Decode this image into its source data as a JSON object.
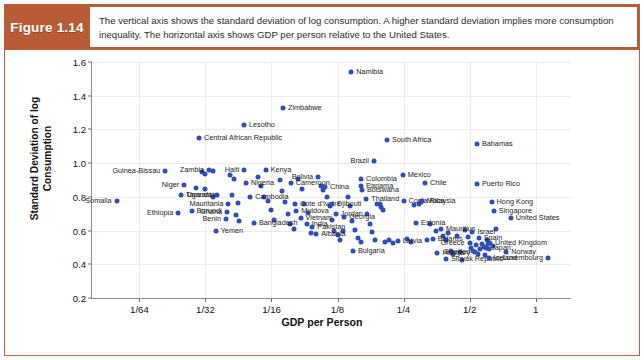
{
  "figure": {
    "badge": "Figure 1.14",
    "caption": "The vertical axis shows the standard deviation of log consumption. A higher standard deviation implies more consumption inequality. The horizontal axis shows GDP per person relative to the United States.",
    "badge_color": "#b95b34",
    "border_color": "#b9613f",
    "dot_color": "#2f4fb5"
  },
  "chart_data": {
    "type": "scatter",
    "title": "",
    "xlabel": "GDP per Person",
    "ylabel": "Standard Deviation of log Consumption",
    "xscale": "log2",
    "xlim": [
      0.0095,
      1.45
    ],
    "ylim": [
      0.2,
      1.6
    ],
    "xticks": [
      {
        "value": 0.015625,
        "label": "1/64"
      },
      {
        "value": 0.03125,
        "label": "1/32"
      },
      {
        "value": 0.0625,
        "label": "1/16"
      },
      {
        "value": 0.125,
        "label": "1/8"
      },
      {
        "value": 0.25,
        "label": "1/4"
      },
      {
        "value": 0.5,
        "label": "1/2"
      },
      {
        "value": 1.0,
        "label": "1"
      }
    ],
    "yticks": [
      0.2,
      0.4,
      0.6,
      0.8,
      1.0,
      1.2,
      1.4,
      1.6
    ],
    "grid": true,
    "legend": "none",
    "points": [
      {
        "name": "Somalia",
        "x": 0.0123,
        "y": 0.775,
        "side": "left"
      },
      {
        "name": "Guinea-Bissau",
        "x": 0.0205,
        "y": 0.952,
        "side": "left"
      },
      {
        "name": "Niger",
        "x": 0.025,
        "y": 0.87,
        "side": "left"
      },
      {
        "name": "Tanzania",
        "x": 0.0242,
        "y": 0.812,
        "side": "right"
      },
      {
        "name": "Ethiopia",
        "x": 0.0235,
        "y": 0.705,
        "side": "left"
      },
      {
        "name": "Burundi",
        "x": 0.027,
        "y": 0.718,
        "side": "right"
      },
      {
        "name": "Zambia",
        "x": 0.0325,
        "y": 0.96,
        "side": "left"
      },
      {
        "name": "Central African Republic",
        "x": 0.0292,
        "y": 1.148,
        "side": "right"
      },
      {
        "name": "Uganda",
        "x": 0.0353,
        "y": 0.81,
        "side": "left"
      },
      {
        "name": "Mauritania",
        "x": 0.0398,
        "y": 0.755,
        "side": "left"
      },
      {
        "name": "Ghana",
        "x": 0.0392,
        "y": 0.712,
        "side": "left"
      },
      {
        "name": "Benin",
        "x": 0.0388,
        "y": 0.668,
        "side": "left"
      },
      {
        "name": "Yemen",
        "x": 0.0348,
        "y": 0.6,
        "side": "right"
      },
      {
        "name": "Lesotho",
        "x": 0.0468,
        "y": 1.228,
        "side": "right"
      },
      {
        "name": "Haiti",
        "x": 0.047,
        "y": 0.96,
        "side": "left"
      },
      {
        "name": "Nigeria",
        "x": 0.0478,
        "y": 0.885,
        "side": "right"
      },
      {
        "name": "Cambodia",
        "x": 0.05,
        "y": 0.798,
        "side": "right"
      },
      {
        "name": "Bangladesh",
        "x": 0.052,
        "y": 0.642,
        "side": "right"
      },
      {
        "name": "Kenya",
        "x": 0.0588,
        "y": 0.958,
        "side": "right"
      },
      {
        "name": "Zimbabwe",
        "x": 0.0705,
        "y": 1.33,
        "side": "right"
      },
      {
        "name": "Cameroon",
        "x": 0.0765,
        "y": 0.88,
        "side": "right"
      },
      {
        "name": "Cote d'Ivoire",
        "x": 0.08,
        "y": 0.76,
        "side": "right"
      },
      {
        "name": "Moldova",
        "x": 0.081,
        "y": 0.718,
        "side": "right"
      },
      {
        "name": "Vietnam",
        "x": 0.0848,
        "y": 0.672,
        "side": "right"
      },
      {
        "name": "India",
        "x": 0.0905,
        "y": 0.64,
        "side": "right"
      },
      {
        "name": "Pakistan",
        "x": 0.096,
        "y": 0.622,
        "side": "right"
      },
      {
        "name": "Albania",
        "x": 0.1,
        "y": 0.578,
        "side": "right"
      },
      {
        "name": "Bolivia",
        "x": 0.102,
        "y": 0.918,
        "side": "left"
      },
      {
        "name": "China",
        "x": 0.1095,
        "y": 0.858,
        "side": "right"
      },
      {
        "name": "Djibouti",
        "x": 0.118,
        "y": 0.758,
        "side": "right"
      },
      {
        "name": "Jordan",
        "x": 0.1225,
        "y": 0.7,
        "side": "right"
      },
      {
        "name": "Georgia",
        "x": 0.134,
        "y": 0.682,
        "side": "right"
      },
      {
        "name": "Namibia",
        "x": 0.1445,
        "y": 1.54,
        "side": "right"
      },
      {
        "name": "Colombia",
        "x": 0.16,
        "y": 0.905,
        "side": "right"
      },
      {
        "name": "Panama",
        "x": 0.16,
        "y": 0.862,
        "side": "right"
      },
      {
        "name": "Botswana",
        "x": 0.1615,
        "y": 0.838,
        "side": "right"
      },
      {
        "name": "Thailand",
        "x": 0.169,
        "y": 0.79,
        "side": "right"
      },
      {
        "name": "Brazil",
        "x": 0.183,
        "y": 1.01,
        "side": "left"
      },
      {
        "name": "Bulgaria",
        "x": 0.147,
        "y": 0.478,
        "side": "right"
      },
      {
        "name": "South Africa",
        "x": 0.21,
        "y": 1.135,
        "side": "right"
      },
      {
        "name": "Mexico",
        "x": 0.248,
        "y": 0.93,
        "side": "right"
      },
      {
        "name": "Costa Rica",
        "x": 0.25,
        "y": 0.778,
        "side": "right"
      },
      {
        "name": "Latvia",
        "x": 0.235,
        "y": 0.54,
        "side": "right"
      },
      {
        "name": "Estonia",
        "x": 0.285,
        "y": 0.645,
        "side": "right"
      },
      {
        "name": "Chile",
        "x": 0.313,
        "y": 0.88,
        "side": "right"
      },
      {
        "name": "Malaysia",
        "x": 0.303,
        "y": 0.775,
        "side": "right"
      },
      {
        "name": "Belarus",
        "x": 0.34,
        "y": 0.548,
        "side": "right"
      },
      {
        "name": "Mauritius",
        "x": 0.37,
        "y": 0.612,
        "side": "right"
      },
      {
        "name": "Hungary",
        "x": 0.357,
        "y": 0.468,
        "side": "right"
      },
      {
        "name": "Slovak Republic",
        "x": 0.39,
        "y": 0.43,
        "side": "right"
      },
      {
        "name": "Bahamas",
        "x": 0.54,
        "y": 1.112,
        "side": "right"
      },
      {
        "name": "Puerto Rico",
        "x": 0.54,
        "y": 0.878,
        "side": "right"
      },
      {
        "name": "Hong Kong",
        "x": 0.63,
        "y": 0.772,
        "side": "right"
      },
      {
        "name": "Singapore",
        "x": 0.645,
        "y": 0.718,
        "side": "right"
      },
      {
        "name": "United States",
        "x": 0.77,
        "y": 0.672,
        "side": "right"
      },
      {
        "name": "Israel",
        "x": 0.515,
        "y": 0.59,
        "side": "right"
      },
      {
        "name": "Spain",
        "x": 0.55,
        "y": 0.558,
        "side": "right"
      },
      {
        "name": "Greece",
        "x": 0.5,
        "y": 0.525,
        "side": "left"
      },
      {
        "name": "United Kingdom",
        "x": 0.62,
        "y": 0.525,
        "side": "right"
      },
      {
        "name": "Japan",
        "x": 0.595,
        "y": 0.498,
        "side": "right"
      },
      {
        "name": "Sweden",
        "x": 0.53,
        "y": 0.47,
        "side": "left"
      },
      {
        "name": "Norway",
        "x": 0.735,
        "y": 0.47,
        "side": "right"
      },
      {
        "name": "Iceland",
        "x": 0.61,
        "y": 0.438,
        "side": "right"
      },
      {
        "name": "Luxembourg",
        "x": 1.14,
        "y": 0.438,
        "side": "left"
      }
    ],
    "unlabeled_points": [
      {
        "x": 0.03,
        "y": 0.945
      },
      {
        "x": 0.0312,
        "y": 0.935
      },
      {
        "x": 0.034,
        "y": 0.952
      },
      {
        "x": 0.0283,
        "y": 0.855
      },
      {
        "x": 0.031,
        "y": 0.848
      },
      {
        "x": 0.034,
        "y": 0.8
      },
      {
        "x": 0.0405,
        "y": 0.932
      },
      {
        "x": 0.042,
        "y": 0.905
      },
      {
        "x": 0.0415,
        "y": 0.812
      },
      {
        "x": 0.044,
        "y": 0.762
      },
      {
        "x": 0.043,
        "y": 0.695
      },
      {
        "x": 0.0445,
        "y": 0.655
      },
      {
        "x": 0.054,
        "y": 0.92
      },
      {
        "x": 0.056,
        "y": 0.862
      },
      {
        "x": 0.0575,
        "y": 0.8
      },
      {
        "x": 0.06,
        "y": 0.775
      },
      {
        "x": 0.062,
        "y": 0.722
      },
      {
        "x": 0.064,
        "y": 0.66
      },
      {
        "x": 0.068,
        "y": 0.9
      },
      {
        "x": 0.07,
        "y": 0.832
      },
      {
        "x": 0.072,
        "y": 0.772
      },
      {
        "x": 0.0745,
        "y": 0.7
      },
      {
        "x": 0.076,
        "y": 0.64
      },
      {
        "x": 0.079,
        "y": 0.608
      },
      {
        "x": 0.083,
        "y": 0.905
      },
      {
        "x": 0.086,
        "y": 0.845
      },
      {
        "x": 0.088,
        "y": 0.76
      },
      {
        "x": 0.092,
        "y": 0.705
      },
      {
        "x": 0.095,
        "y": 0.585
      },
      {
        "x": 0.105,
        "y": 0.862
      },
      {
        "x": 0.1075,
        "y": 0.84
      },
      {
        "x": 0.112,
        "y": 0.8
      },
      {
        "x": 0.115,
        "y": 0.745
      },
      {
        "x": 0.118,
        "y": 0.66
      },
      {
        "x": 0.12,
        "y": 0.6
      },
      {
        "x": 0.125,
        "y": 0.572
      },
      {
        "x": 0.128,
        "y": 0.545
      },
      {
        "x": 0.132,
        "y": 0.598
      },
      {
        "x": 0.14,
        "y": 0.8
      },
      {
        "x": 0.142,
        "y": 0.745
      },
      {
        "x": 0.145,
        "y": 0.658
      },
      {
        "x": 0.15,
        "y": 0.605
      },
      {
        "x": 0.155,
        "y": 0.558
      },
      {
        "x": 0.16,
        "y": 0.535
      },
      {
        "x": 0.17,
        "y": 0.7
      },
      {
        "x": 0.175,
        "y": 0.64
      },
      {
        "x": 0.18,
        "y": 0.59
      },
      {
        "x": 0.185,
        "y": 0.545
      },
      {
        "x": 0.19,
        "y": 0.76
      },
      {
        "x": 0.195,
        "y": 0.755
      },
      {
        "x": 0.198,
        "y": 0.74
      },
      {
        "x": 0.202,
        "y": 0.725
      },
      {
        "x": 0.205,
        "y": 0.535
      },
      {
        "x": 0.215,
        "y": 0.545
      },
      {
        "x": 0.225,
        "y": 0.528
      },
      {
        "x": 0.26,
        "y": 0.548
      },
      {
        "x": 0.27,
        "y": 0.53
      },
      {
        "x": 0.28,
        "y": 0.75
      },
      {
        "x": 0.295,
        "y": 0.76
      },
      {
        "x": 0.32,
        "y": 0.545
      },
      {
        "x": 0.33,
        "y": 0.64
      },
      {
        "x": 0.35,
        "y": 0.598
      },
      {
        "x": 0.38,
        "y": 0.565
      },
      {
        "x": 0.39,
        "y": 0.545
      },
      {
        "x": 0.4,
        "y": 0.588
      },
      {
        "x": 0.41,
        "y": 0.478
      },
      {
        "x": 0.42,
        "y": 0.462
      },
      {
        "x": 0.44,
        "y": 0.568
      },
      {
        "x": 0.45,
        "y": 0.47
      },
      {
        "x": 0.46,
        "y": 0.428
      },
      {
        "x": 0.475,
        "y": 0.605
      },
      {
        "x": 0.49,
        "y": 0.56
      },
      {
        "x": 0.505,
        "y": 0.498
      },
      {
        "x": 0.52,
        "y": 0.478
      },
      {
        "x": 0.535,
        "y": 0.512
      },
      {
        "x": 0.545,
        "y": 0.462
      },
      {
        "x": 0.56,
        "y": 0.488
      },
      {
        "x": 0.57,
        "y": 0.52
      },
      {
        "x": 0.58,
        "y": 0.505
      },
      {
        "x": 0.585,
        "y": 0.455
      },
      {
        "x": 0.6,
        "y": 0.542
      },
      {
        "x": 0.605,
        "y": 0.52
      },
      {
        "x": 0.61,
        "y": 0.49
      },
      {
        "x": 0.64,
        "y": 0.508
      },
      {
        "x": 0.66,
        "y": 0.612
      },
      {
        "x": 0.3,
        "y": 0.772
      }
    ]
  }
}
